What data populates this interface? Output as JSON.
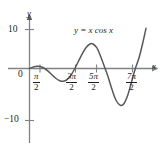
{
  "figure": {
    "equation_label": "y = x cos x",
    "x_axis_name": "x",
    "y_axis_name": "y"
  },
  "ticks": {
    "y_positive": "10",
    "y_origin": "0",
    "y_negative": "−10"
  },
  "x_labels": [
    {
      "numerator": "π",
      "denominator": "2"
    },
    {
      "numerator": "3π",
      "denominator": "2"
    },
    {
      "numerator": "5π",
      "denominator": "2"
    },
    {
      "numerator": "7π",
      "denominator": "2"
    }
  ],
  "colors": {
    "curve": "#58595b",
    "axis": "#808285",
    "text": "#231f20",
    "background": "#ffffff"
  },
  "chart_data": {
    "type": "line",
    "title": "",
    "subtitle": "",
    "xlabel": "x",
    "ylabel": "y",
    "function": "y = x cos x",
    "grid": false,
    "legend": "none",
    "annotations": [
      "y = x cos x"
    ],
    "xlim": [
      -0.6,
      12.2
    ],
    "ylim": [
      -13.5,
      12.5
    ],
    "x_ticks": [
      1.5708,
      4.7124,
      7.854,
      10.9956
    ],
    "x_tick_labels": [
      "π/2",
      "3π/2",
      "5π/2",
      "7π/2"
    ],
    "y_ticks": [
      -10,
      0,
      10
    ],
    "y_tick_labels": [
      "−10",
      "0",
      "10"
    ],
    "series": [
      {
        "name": "y = x cos x",
        "x": [
          0,
          0.3,
          0.6,
          0.9,
          1.2,
          1.5708,
          1.9,
          2.3,
          2.7,
          3.1416,
          3.5,
          3.9,
          4.3,
          4.7124,
          5.1,
          5.5,
          5.9,
          6.2832,
          6.6,
          7.0,
          7.4,
          7.854,
          8.2,
          8.6,
          9.0,
          9.4248,
          9.8,
          10.2,
          10.6,
          10.9956,
          11.4,
          11.8,
          12.1
        ],
        "y": [
          0,
          0.287,
          0.495,
          0.559,
          0.435,
          0,
          -0.622,
          -1.531,
          -2.44,
          -3.142,
          -3.277,
          -2.842,
          -1.745,
          0,
          1.928,
          3.9,
          5.445,
          6.283,
          6.283,
          5.28,
          3.03,
          0,
          -2.455,
          -5.603,
          -8.2,
          -9.42,
          -9.032,
          -6.866,
          -3.405,
          0,
          2.94,
          6.93,
          10.3
        ]
      }
    ]
  }
}
